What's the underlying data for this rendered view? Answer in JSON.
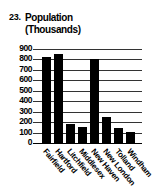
{
  "problem_number": "23.",
  "chart_data": {
    "type": "bar",
    "title": "Population (Thousands)",
    "title_lines": [
      "Population",
      "(Thousands)"
    ],
    "xlabel": "",
    "ylabel": "",
    "categories": [
      "Fairfield",
      "Hartford",
      "Litchfield",
      "Middlesex",
      "New Haven",
      "New London",
      "Tolland",
      "Windham"
    ],
    "values": [
      820,
      850,
      180,
      150,
      800,
      250,
      140,
      110
    ],
    "ylim": [
      0,
      900
    ],
    "yticks": [
      "900",
      "800",
      "700",
      "600",
      "500",
      "400",
      "300",
      "200",
      "100",
      "0"
    ],
    "grid": true,
    "legend": null
  }
}
